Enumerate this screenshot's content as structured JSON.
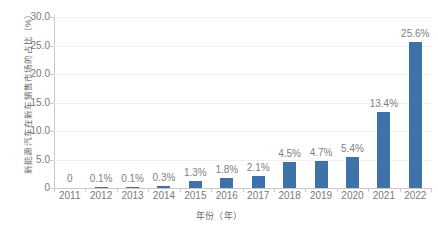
{
  "chart_data": {
    "type": "bar",
    "title": "",
    "subtitle": "",
    "xlabel": "年份（年）",
    "ylabel": "新能源汽车在新车销售市场的占比（%）",
    "categories": [
      "2011",
      "2012",
      "2013",
      "2014",
      "2015",
      "2016",
      "2017",
      "2018",
      "2019",
      "2020",
      "2021",
      "2022"
    ],
    "values": [
      0,
      0.1,
      0.1,
      0.3,
      1.3,
      1.8,
      2.1,
      4.5,
      4.7,
      5.4,
      13.4,
      25.6
    ],
    "data_labels": [
      "0",
      "0.1%",
      "0.1%",
      "0.3%",
      "1.3%",
      "1.8%",
      "2.1%",
      "4.5%",
      "4.7%",
      "5.4%",
      "13.4%",
      "25.6%"
    ],
    "ylim": [
      0,
      30
    ],
    "y_ticks": [
      0,
      5,
      10,
      15,
      20,
      25,
      30
    ],
    "y_tick_labels": [
      "0",
      "5.0",
      "10.0",
      "15.0",
      "20.0",
      "25.0",
      "30.0"
    ],
    "grid": true,
    "legend": false,
    "series_color": "#3e72a8",
    "label_color": "#808080",
    "axis_color": "#c9c9c9",
    "gridline_color": "#f0f0f0",
    "background": "#ffffff"
  }
}
